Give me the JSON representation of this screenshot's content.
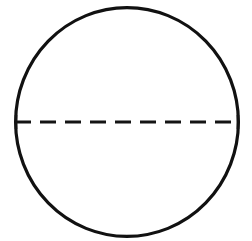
{
  "figure": {
    "background_color": "#ffffff",
    "width": 252,
    "height": 241,
    "shape": {
      "name": "circle",
      "stroke_color": "#111111",
      "stroke_width": 3.2,
      "fill": "none",
      "center_x": 127,
      "center_y": 122,
      "radius_x": 113,
      "radius_y": 116,
      "bounds": {
        "left": 14,
        "top": 6,
        "right": 240,
        "bottom": 238
      }
    },
    "diameter": {
      "name": "horizontal-dashed-diameter",
      "orientation": "horizontal",
      "stroke_color": "#141414",
      "stroke_width": 3.1,
      "dash_length": 16,
      "gap_length": 9,
      "dash_count": 9,
      "y": 122,
      "x_start": 15,
      "x_end": 239
    },
    "endpoints": {
      "left_cap_x": 16,
      "right_cap_x": 238,
      "cap_half_height": 7,
      "stroke_color": "#141414",
      "stroke_width": 2.6
    }
  }
}
